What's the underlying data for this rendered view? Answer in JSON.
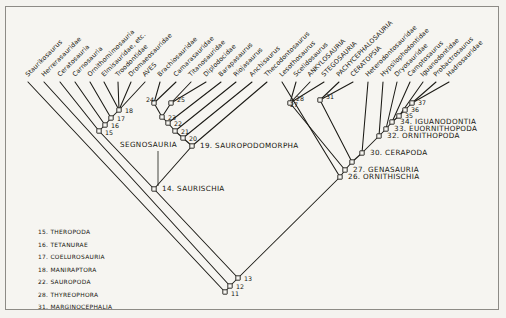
{
  "figure": {
    "type": "cladogram",
    "background_color": "#f4f3ef",
    "line_color": "#1b1a15"
  },
  "tips": [
    {
      "id": "t1",
      "label": "Staurikosaurus",
      "x": 28,
      "y": 77
    },
    {
      "id": "t2",
      "label": "Herrerasauridae",
      "x": 44,
      "y": 77
    },
    {
      "id": "t3",
      "label": "Ceratosauria",
      "x": 60,
      "y": 77
    },
    {
      "id": "t4",
      "label": "Carnosauria",
      "x": 75,
      "y": 77
    },
    {
      "id": "t5",
      "label": "Ornithomimosauria",
      "x": 90,
      "y": 77
    },
    {
      "id": "t6",
      "label": "Elmisauridae, etc.",
      "x": 104,
      "y": 77
    },
    {
      "id": "t7",
      "label": "Troodontidae",
      "x": 118,
      "y": 77
    },
    {
      "id": "t8",
      "label": "Dromaeosauridae",
      "x": 131,
      "y": 77
    },
    {
      "id": "t9",
      "label": "AVES",
      "x": 145,
      "y": 77
    },
    {
      "id": "t10",
      "label": "Brachiosauridae",
      "x": 160,
      "y": 77
    },
    {
      "id": "t11",
      "label": "Camarasauridae",
      "x": 176,
      "y": 77
    },
    {
      "id": "t12",
      "label": "Titanosauridae",
      "x": 191,
      "y": 77
    },
    {
      "id": "t13",
      "label": "Diplodocidae",
      "x": 206,
      "y": 77
    },
    {
      "id": "t14",
      "label": "Barapasaurus",
      "x": 221,
      "y": 77
    },
    {
      "id": "t15",
      "label": "Riojasaurus",
      "x": 236,
      "y": 77
    },
    {
      "id": "t16",
      "label": "Anchisaurus",
      "x": 252,
      "y": 77
    },
    {
      "id": "t17",
      "label": "Thecodontosaurus",
      "x": 267,
      "y": 77
    },
    {
      "id": "t18",
      "label": "Lesothosaurus",
      "x": 282,
      "y": 77
    },
    {
      "id": "t19",
      "label": "Scelidosaurus",
      "x": 296,
      "y": 77
    },
    {
      "id": "t20",
      "label": "ANKYLOSAURIA",
      "x": 310,
      "y": 77
    },
    {
      "id": "t21",
      "label": "STEGOSAURIA",
      "x": 324,
      "y": 77
    },
    {
      "id": "t22",
      "label": "PACHYCEPHALOSAURIA",
      "x": 339,
      "y": 77
    },
    {
      "id": "t23",
      "label": "CERATOPSIA",
      "x": 353,
      "y": 77
    },
    {
      "id": "t24",
      "label": "Heterodontosauridae",
      "x": 368,
      "y": 77
    },
    {
      "id": "t25",
      "label": "Hypsilophodontidae",
      "x": 383,
      "y": 77
    },
    {
      "id": "t26",
      "label": "Dryosauridae",
      "x": 397,
      "y": 77
    },
    {
      "id": "t27",
      "label": "Camptosaurus",
      "x": 410,
      "y": 77
    },
    {
      "id": "t28",
      "label": "Iguanodontidae",
      "x": 423,
      "y": 77
    },
    {
      "id": "t29",
      "label": "Probactrosaurus",
      "x": 436,
      "y": 77
    },
    {
      "id": "t30",
      "label": "Hadrosauridae",
      "x": 449,
      "y": 77
    }
  ],
  "nodes": [
    {
      "num": "11",
      "name": "",
      "x": 225,
      "y": 292
    },
    {
      "num": "12",
      "name": "",
      "x": 230,
      "y": 286
    },
    {
      "num": "13",
      "name": "",
      "x": 238,
      "y": 278
    },
    {
      "num": "14",
      "name": "SAURISCHIA",
      "x": 154,
      "y": 189
    },
    {
      "num": "15",
      "name": "",
      "x": 99,
      "y": 131
    },
    {
      "num": "16",
      "name": "",
      "x": 105,
      "y": 125
    },
    {
      "num": "17",
      "name": "",
      "x": 111,
      "y": 118
    },
    {
      "num": "18",
      "name": "",
      "x": 119,
      "y": 110
    },
    {
      "num": "19",
      "name": "SAUROPODOMORPHA",
      "x": 192,
      "y": 146
    },
    {
      "num": "20",
      "name": "",
      "x": 183,
      "y": 138
    },
    {
      "num": "21",
      "name": "",
      "x": 175,
      "y": 131
    },
    {
      "num": "22",
      "name": "",
      "x": 168,
      "y": 123
    },
    {
      "num": "23",
      "name": "",
      "x": 162,
      "y": 117
    },
    {
      "num": "24",
      "name": "",
      "x": 154,
      "y": 103
    },
    {
      "num": "25",
      "name": "",
      "x": 171,
      "y": 103
    },
    {
      "num": "26",
      "name": "ORNITHISCHIA",
      "x": 340,
      "y": 177
    },
    {
      "num": "27",
      "name": "GENASAURIA",
      "x": 345,
      "y": 170
    },
    {
      "num": "28",
      "name": "",
      "x": 290,
      "y": 103
    },
    {
      "num": "29",
      "name": "",
      "x": 352,
      "y": 162
    },
    {
      "num": "30",
      "name": "CERAPODA",
      "x": 362,
      "y": 153
    },
    {
      "num": "31",
      "name": "",
      "x": 320,
      "y": 100
    },
    {
      "num": "32",
      "name": "ORNITHOPODA",
      "x": 379,
      "y": 136
    },
    {
      "num": "33",
      "name": "EUORNITHOPODA",
      "x": 386,
      "y": 129
    },
    {
      "num": "34",
      "name": "IGUANODONTIA",
      "x": 392,
      "y": 122
    },
    {
      "num": "35",
      "name": "",
      "x": 399,
      "y": 116
    },
    {
      "num": "36",
      "name": "",
      "x": 405,
      "y": 110
    },
    {
      "num": "37",
      "name": "",
      "x": 412,
      "y": 103
    }
  ],
  "annotation": {
    "segnosauria_label": "SEGNOSAURIA",
    "segnosauria_x": 120,
    "segnosauria_y": 147
  },
  "legend": {
    "items": [
      "15. THEROPODA",
      "16. TETANURAE",
      "17. COELUROSAURIA",
      "18. MANIRAPTORA",
      "22. SAUROPODA",
      "28. THYREOPHORA",
      "31. MARGINOCEPHALIA"
    ]
  },
  "named_node_labels": [
    {
      "text": "19. SAUROPODOMORPHA",
      "x": 200,
      "y": 148
    },
    {
      "text": "14. SAURISCHIA",
      "x": 162,
      "y": 191
    },
    {
      "text": "26. ORNITHISCHIA",
      "x": 348,
      "y": 179
    },
    {
      "text": "27. GENASAURIA",
      "x": 353,
      "y": 172
    },
    {
      "text": "30. CERAPODA",
      "x": 370,
      "y": 155
    },
    {
      "text": "32. ORNITHOPODA",
      "x": 387,
      "y": 138
    },
    {
      "text": "33. EUORNITHOPODA",
      "x": 394,
      "y": 131
    },
    {
      "text": "34. IGUANODONTIA",
      "x": 400,
      "y": 124
    }
  ],
  "plain_node_numbers": [
    {
      "text": "11",
      "x": 231,
      "y": 296
    },
    {
      "text": "12",
      "x": 236,
      "y": 289
    },
    {
      "text": "13",
      "x": 244,
      "y": 281
    },
    {
      "text": "15",
      "x": 105,
      "y": 135
    },
    {
      "text": "16",
      "x": 111,
      "y": 128
    },
    {
      "text": "17",
      "x": 117,
      "y": 121
    },
    {
      "text": "18",
      "x": 125,
      "y": 113
    },
    {
      "text": "20",
      "x": 189,
      "y": 141
    },
    {
      "text": "21",
      "x": 181,
      "y": 134
    },
    {
      "text": "22",
      "x": 174,
      "y": 126
    },
    {
      "text": "23",
      "x": 168,
      "y": 120
    },
    {
      "text": "24",
      "x": 146,
      "y": 102
    },
    {
      "text": "25",
      "x": 177,
      "y": 102
    },
    {
      "text": "28",
      "x": 296,
      "y": 101
    },
    {
      "text": "27",
      "x": 290,
      "y": 107
    },
    {
      "text": "31",
      "x": 326,
      "y": 99
    },
    {
      "text": "35",
      "x": 405,
      "y": 118
    },
    {
      "text": "36",
      "x": 411,
      "y": 112
    },
    {
      "text": "37",
      "x": 418,
      "y": 105
    }
  ]
}
